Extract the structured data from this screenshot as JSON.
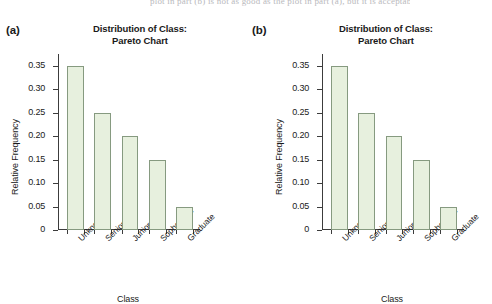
{
  "page": {
    "background": "#ffffff",
    "top_scan_text": "plot in part (b) is not as good as the plot in part (a), but it is acceptable."
  },
  "colors": {
    "bar_fill": "#e7f0de",
    "bar_edge": "#869a80",
    "axis": "#3c3c3c",
    "text": "#1a1a1a"
  },
  "panels": [
    {
      "label": "(a)",
      "name": "panel-a",
      "chart_data": {
        "type": "bar",
        "title": "Distribution of Class: Pareto Chart",
        "title_line1": "Distribution of Class:",
        "title_line2": "Pareto Chart",
        "xlabel": "Class",
        "ylabel": "Relative Frequency",
        "categories": [
          "Unknown",
          "Senior",
          "Junior",
          "Sophomore",
          "Graduate"
        ],
        "values": [
          0.35,
          0.25,
          0.2,
          0.15,
          0.05
        ],
        "ylim": [
          0,
          0.375
        ],
        "yticks": [
          0,
          0.05,
          0.1,
          0.15,
          0.2,
          0.25,
          0.3,
          0.35
        ],
        "ytick_labels": [
          "0",
          "0.05",
          "0.10",
          "0.15",
          "0.20",
          "0.25",
          "0.30",
          "0.35"
        ],
        "grid": false,
        "legend": false,
        "xtick_label_rotation": -45
      }
    },
    {
      "label": "(b)",
      "name": "panel-b",
      "chart_data": {
        "type": "bar",
        "title": "Distribution of Class: Pareto Chart",
        "title_line1": "Distribution of Class:",
        "title_line2": "Pareto Chart",
        "xlabel": "Class",
        "ylabel": "Relative Frequency",
        "categories": [
          "Unknown",
          "Senior",
          "Junior",
          "Sophomore",
          "Graduate"
        ],
        "values": [
          0.35,
          0.25,
          0.2,
          0.15,
          0.05
        ],
        "ylim": [
          0,
          0.375
        ],
        "yticks": [
          0,
          0.05,
          0.1,
          0.15,
          0.2,
          0.25,
          0.3,
          0.35
        ],
        "ytick_labels": [
          "0",
          "0.05",
          "0.10",
          "0.15",
          "0.20",
          "0.25",
          "0.30",
          "0.35"
        ],
        "grid": false,
        "legend": false,
        "xtick_label_rotation": -45
      }
    }
  ],
  "chart_data": [
    {
      "type": "bar",
      "title": "Distribution of Class: Pareto Chart",
      "panel": "(a)",
      "xlabel": "Class",
      "ylabel": "Relative Frequency",
      "categories": [
        "Unknown",
        "Senior",
        "Junior",
        "Sophomore",
        "Graduate"
      ],
      "values": [
        0.35,
        0.25,
        0.2,
        0.15,
        0.05
      ],
      "ylim": [
        0,
        0.375
      ],
      "yticks": [
        0,
        0.05,
        0.1,
        0.15,
        0.2,
        0.25,
        0.3,
        0.35
      ],
      "grid": false,
      "legend": false
    },
    {
      "type": "bar",
      "title": "Distribution of Class: Pareto Chart",
      "panel": "(b)",
      "xlabel": "Class",
      "ylabel": "Relative Frequency",
      "categories": [
        "Unknown",
        "Senior",
        "Junior",
        "Sophomore",
        "Graduate"
      ],
      "values": [
        0.35,
        0.25,
        0.2,
        0.15,
        0.05
      ],
      "ylim": [
        0,
        0.375
      ],
      "yticks": [
        0,
        0.05,
        0.1,
        0.15,
        0.2,
        0.25,
        0.3,
        0.35
      ],
      "grid": false,
      "legend": false
    }
  ]
}
